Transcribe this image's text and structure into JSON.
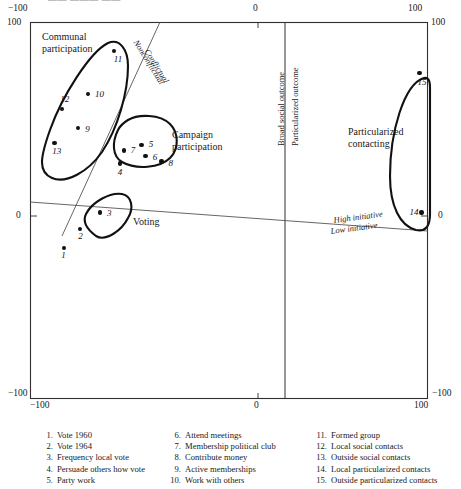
{
  "figure": {
    "clipped_title": "—— ——— ——",
    "type": "scatter-conceptual-map"
  },
  "axes": {
    "top_left_outer": "−100",
    "top_left_inner": "100",
    "top_center": "0",
    "top_right_outer": "100",
    "top_right_inner": "100",
    "left_middle": "0",
    "right_middle": "0",
    "bottom_left_outer": "−100",
    "bottom_left_inner": "−100",
    "bottom_center": "0",
    "bottom_right_inner": "100",
    "bottom_right_outer": "−100"
  },
  "region_labels": {
    "communal": "Communal\nparticipation",
    "campaign": "Campaign\nparticipation",
    "voting": "Voting",
    "particularized": "Particularized\ncontacting"
  },
  "dimension_labels": {
    "broad_social_outcome": "Broad social outcome",
    "particularized_outcome": "Particularized outcome",
    "nonconflictual": "Nonconflictual",
    "conflictual": "Conflictual",
    "high_initiative": "High initiative",
    "low_initiative": "Low initiative"
  },
  "legend": {
    "col1": [
      {
        "n": "1.",
        "label": "Vote 1960"
      },
      {
        "n": "2.",
        "label": "Vote 1964"
      },
      {
        "n": "3.",
        "label": "Frequency local vote"
      },
      {
        "n": "4.",
        "label": "Persuade others how vote"
      },
      {
        "n": "5.",
        "label": "Party work"
      }
    ],
    "col2": [
      {
        "n": "6.",
        "label": "Attend meetings"
      },
      {
        "n": "7.",
        "label": "Membership political club"
      },
      {
        "n": "8.",
        "label": "Contribute money"
      },
      {
        "n": "9.",
        "label": "Active memberships"
      },
      {
        "n": "10.",
        "label": "Work with others"
      }
    ],
    "col3": [
      {
        "n": "11.",
        "label": "Formed group"
      },
      {
        "n": "12.",
        "label": "Local social contacts"
      },
      {
        "n": "13.",
        "label": "Outside social contacts"
      },
      {
        "n": "14.",
        "label": "Local particularized contacts"
      },
      {
        "n": "15.",
        "label": "Outside particularized contacts"
      }
    ]
  },
  "chart_data": {
    "type": "scatter",
    "title": "",
    "xlabel": "",
    "ylabel": "",
    "xlim": [
      -100,
      100
    ],
    "ylim": [
      -100,
      100
    ],
    "grid": false,
    "legend_position": "below-plot",
    "annotations": [
      "Nonconflictual",
      "Conflictual",
      "Broad social outcome",
      "Particularized outcome",
      "High initiative",
      "Low initiative"
    ],
    "clusters": [
      {
        "name": "Communal participation",
        "point_ids": [
          9,
          10,
          11,
          12,
          13
        ]
      },
      {
        "name": "Campaign participation",
        "point_ids": [
          4,
          5,
          6,
          7,
          8
        ]
      },
      {
        "name": "Voting",
        "point_ids": [
          1,
          2,
          3
        ]
      },
      {
        "name": "Particularized contacting",
        "point_ids": [
          14,
          15
        ]
      }
    ],
    "points": [
      {
        "id": 1,
        "label": "Vote 1960",
        "x": -83,
        "y": -20,
        "cluster": "Voting"
      },
      {
        "id": 2,
        "label": "Vote 1964",
        "x": -75,
        "y": -10,
        "cluster": "Voting"
      },
      {
        "id": 3,
        "label": "Frequency local vote",
        "x": -65,
        "y": -1,
        "cluster": "Voting"
      },
      {
        "id": 4,
        "label": "Persuade others how vote",
        "x": -55,
        "y": 25,
        "cluster": "Campaign participation"
      },
      {
        "id": 5,
        "label": "Party work",
        "x": -44,
        "y": 35,
        "cluster": "Campaign participation"
      },
      {
        "id": 6,
        "label": "Attend meetings",
        "x": -42,
        "y": 29,
        "cluster": "Campaign participation"
      },
      {
        "id": 7,
        "label": "Membership political club",
        "x": -53,
        "y": 32,
        "cluster": "Campaign participation"
      },
      {
        "id": 8,
        "label": "Contribute money",
        "x": -34,
        "y": 26,
        "cluster": "Campaign participation"
      },
      {
        "id": 9,
        "label": "Active memberships",
        "x": -76,
        "y": 44,
        "cluster": "Communal participation"
      },
      {
        "id": 10,
        "label": "Work with others",
        "x": -71,
        "y": 62,
        "cluster": "Communal participation"
      },
      {
        "id": 11,
        "label": "Formed group",
        "x": -58,
        "y": 85,
        "cluster": "Communal participation"
      },
      {
        "id": 12,
        "label": "Local social contacts",
        "x": -84,
        "y": 54,
        "cluster": "Communal participation"
      },
      {
        "id": 13,
        "label": "Outside social contacts",
        "x": -88,
        "y": 36,
        "cluster": "Communal participation"
      },
      {
        "id": 14,
        "label": "Local particularized contacts",
        "x": 97,
        "y": -1,
        "cluster": "Particularized contacting"
      },
      {
        "id": 15,
        "label": "Outside particularized contacts",
        "x": 96,
        "y": 73,
        "cluster": "Particularized contacting"
      }
    ]
  }
}
